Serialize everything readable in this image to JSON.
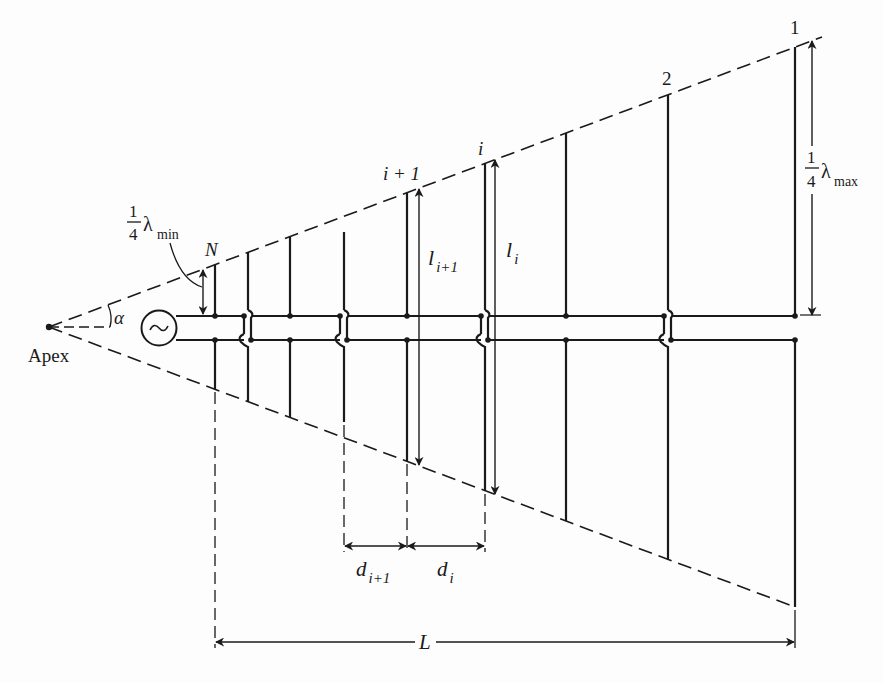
{
  "diagram": {
    "labels": {
      "apex": "Apex",
      "alpha": "α",
      "source": "~",
      "element_N": "N",
      "element_i_plus_1": "i + 1",
      "element_i": "i",
      "element_2": "2",
      "element_1": "1",
      "length_i_plus_1_main": "l",
      "length_i_plus_1_sub": "i+1",
      "length_i_main": "l",
      "length_i_sub": "i",
      "spacing_i_plus_1_main": "d",
      "spacing_i_plus_1_sub": "i+1",
      "spacing_i_main": "d",
      "spacing_i_sub": "i",
      "total_length": "L",
      "lambda_min_num": "1",
      "lambda_min_den": "4",
      "lambda_min_sym": "λ",
      "lambda_min_sub": "min",
      "lambda_max_num": "1",
      "lambda_max_den": "4",
      "lambda_max_sym": "λ",
      "lambda_max_sub": "max"
    },
    "geometry": {
      "apex": [
        49,
        327
      ],
      "feeder_top_y": 316,
      "feeder_bottom_y": 340,
      "element_x": [
        215,
        248,
        290,
        344,
        407,
        485,
        566,
        668,
        795
      ],
      "crossover_x": [
        248,
        344,
        485,
        668
      ],
      "stroke_color": "#1a1a1a"
    }
  }
}
